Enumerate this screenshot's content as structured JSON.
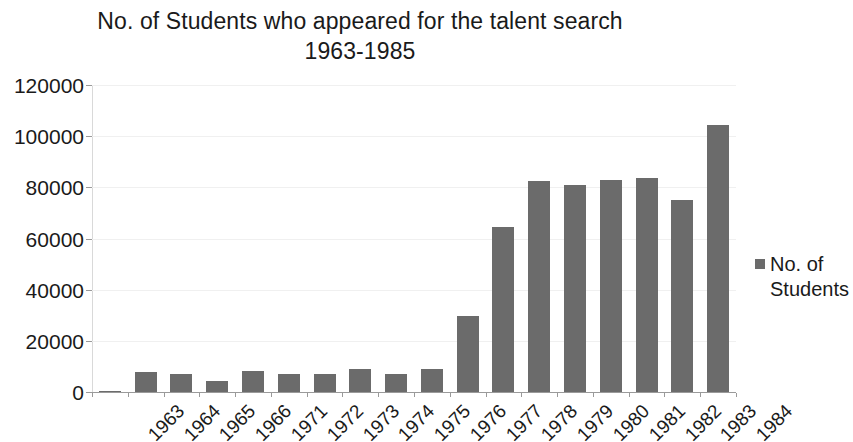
{
  "chart_data": {
    "type": "bar",
    "title": "No. of Students who appeared for the talent search 1963-1985",
    "title_line1": "No. of Students who appeared for the talent search",
    "title_line2": "1963-1985",
    "xlabel": "",
    "ylabel": "",
    "ylim": [
      0,
      120000
    ],
    "ytick_step": 20000,
    "yticks": [
      "120000",
      "100000",
      "80000",
      "60000",
      "40000",
      "20000",
      "0"
    ],
    "ytick_values": [
      120000,
      100000,
      80000,
      60000,
      40000,
      20000,
      0
    ],
    "grid": true,
    "legend_position": "right",
    "bar_color": "#6b6b6b",
    "categories": [
      "1963",
      "1964",
      "1965",
      "1966",
      "1971",
      "1972",
      "1973",
      "1974",
      "1975",
      "1976",
      "1977",
      "1978",
      "1979",
      "1980",
      "1981",
      "1982",
      "1983",
      "1984"
    ],
    "series": [
      {
        "name": "No. of Students",
        "values": [
          300,
          7800,
          7000,
          4300,
          8200,
          7000,
          7000,
          9000,
          7000,
          9000,
          29700,
          64500,
          82500,
          81000,
          83000,
          83500,
          75000,
          104500
        ]
      }
    ]
  },
  "legend": {
    "entries": [
      {
        "label": "No. of Students",
        "color": "#6b6b6b",
        "marker": "square-marker"
      }
    ]
  }
}
